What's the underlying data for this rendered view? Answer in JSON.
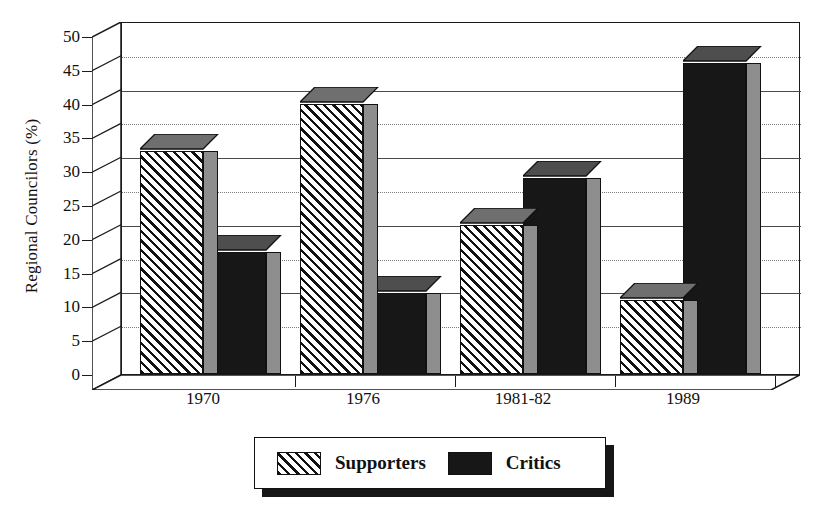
{
  "chart_data": {
    "type": "bar",
    "title": "",
    "subtitle": "",
    "xlabel": "",
    "ylabel": "Regional Councilors (%)",
    "categories": [
      "1970",
      "1976",
      "1981-82",
      "1989"
    ],
    "series": [
      {
        "name": "Supporters",
        "values": [
          33,
          40,
          22,
          11
        ],
        "pattern": "diagonal-hatch"
      },
      {
        "name": "Critics",
        "values": [
          18,
          12,
          29,
          46
        ],
        "pattern": "solid-black"
      }
    ],
    "ylim": [
      0,
      50
    ],
    "yticks": [
      0,
      5,
      10,
      15,
      20,
      25,
      30,
      35,
      40,
      45,
      50
    ],
    "ytick_labels": [
      "0",
      "5",
      "10",
      "15",
      "20",
      "25",
      "30",
      "35",
      "40",
      "45",
      "50"
    ],
    "grid": true,
    "legend_position": "bottom-center",
    "style": "3d-isometric",
    "colors": {
      "supporters_fill": "#ffffff",
      "supporters_hatch": "#111111",
      "critics_fill": "#171717",
      "side_face": "#8e8e8e",
      "axis": "#1a1a1a",
      "gridline": "#4a4a4a",
      "background": "#ffffff"
    }
  },
  "legend": {
    "entries": [
      {
        "label": "Supporters",
        "swatch": "hatch-swatch"
      },
      {
        "label": "Critics",
        "swatch": "black-swatch"
      }
    ]
  }
}
